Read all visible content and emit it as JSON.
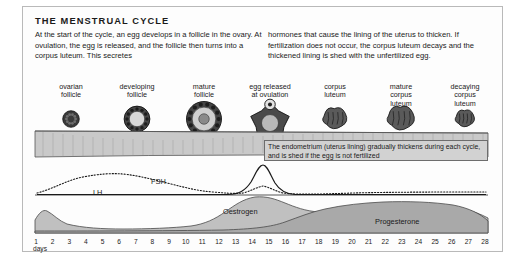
{
  "title": "THE MENSTRUAL CYCLE",
  "intro": {
    "left": "At the start of the cycle, an egg develops in a follicle in the ovary.  At ovulation, the egg is released, and the follicle then turns into a corpus luteum. This secretes",
    "right": "hormones that cause the lining of the uterus to thicken. If fertilization does not occur, the corpus luteum decays and the thickened lining is shed with the unfertilized egg."
  },
  "stages": [
    {
      "label": "ovarian\nfollicle",
      "icon": "ovarian-follicle-icon",
      "x": 48,
      "size": 9
    },
    {
      "label": "developing\nfollicle",
      "icon": "developing-follicle-icon",
      "x": 114,
      "size": 14
    },
    {
      "label": "mature\nfollicle",
      "icon": "mature-follicle-icon",
      "x": 181,
      "size": 19
    },
    {
      "label": "egg released\nat ovulation",
      "icon": "egg-released-icon",
      "x": 247,
      "size": 22
    },
    {
      "label": "corpus\nluteum",
      "icon": "corpus-luteum-icon",
      "x": 312,
      "size": 15
    },
    {
      "label": "mature\ncorpus\nluteum",
      "icon": "mature-corpus-luteum-icon",
      "x": 378,
      "size": 17
    },
    {
      "label": "decaying\ncorpus\nluteum",
      "icon": "decaying-corpus-luteum-icon",
      "x": 442,
      "size": 12
    }
  ],
  "endometrium_note": "The endometrium (uterus lining) gradually thickens during each cycle, and is shed if the egg is not fertilized",
  "hormone_labels": {
    "lh": "LH",
    "fsh": "FSH",
    "oestrogen": "Oestrogen",
    "progesterone": "Progesterone"
  },
  "axis": {
    "unit_label": "days",
    "days": [
      1,
      2,
      3,
      4,
      5,
      6,
      7,
      8,
      9,
      10,
      11,
      12,
      13,
      14,
      15,
      16,
      17,
      18,
      19,
      20,
      21,
      22,
      23,
      24,
      25,
      26,
      27,
      28
    ]
  },
  "colors": {
    "panel_border": "#b9b9b9",
    "ink": "#1a1a1a",
    "endometrium_fill": "#c9c9c9",
    "oestrogen_fill": "#c0c0c0",
    "progesterone_fill": "#a9a9a9",
    "note_fill": "#d2d2d2"
  },
  "chart_data": {
    "type": "line",
    "title": "THE MENSTRUAL CYCLE",
    "xlabel": "days",
    "ylabel": "",
    "xlim": [
      1,
      28
    ],
    "grid": false,
    "legend": "inline-labels",
    "series": [
      {
        "name": "FSH",
        "style": "dotted",
        "x": [
          1,
          3,
          5,
          7,
          9,
          11,
          13,
          14,
          15,
          17,
          19,
          21,
          23,
          25,
          28
        ],
        "values": [
          6,
          16,
          22,
          24,
          22,
          18,
          14,
          20,
          13,
          8,
          8,
          8,
          8,
          7,
          6
        ]
      },
      {
        "name": "LH",
        "style": "solid",
        "x": [
          1,
          5,
          9,
          11,
          12,
          13,
          14,
          15,
          16,
          17,
          19,
          22,
          25,
          28
        ],
        "values": [
          4,
          4,
          4,
          5,
          10,
          30,
          54,
          30,
          10,
          5,
          4,
          4,
          4,
          4
        ]
      },
      {
        "name": "Oestrogen",
        "style": "filled-area",
        "x": [
          1,
          2,
          4,
          6,
          8,
          10,
          11,
          12,
          13,
          14,
          15,
          16,
          17,
          18,
          19,
          20,
          22,
          24,
          26,
          27,
          28
        ],
        "values": [
          16,
          12,
          7,
          6,
          6,
          7,
          10,
          20,
          32,
          40,
          38,
          33,
          30,
          29,
          28,
          30,
          33,
          33,
          28,
          16,
          4
        ]
      },
      {
        "name": "Progesterone",
        "style": "filled-area",
        "x": [
          1,
          5,
          10,
          14,
          15,
          16,
          17,
          18,
          19,
          20,
          21,
          22,
          23,
          24,
          25,
          26,
          27,
          28
        ],
        "values": [
          3,
          3,
          3,
          4,
          6,
          9,
          13,
          18,
          22,
          25,
          27,
          28,
          29,
          28,
          26,
          22,
          15,
          4
        ]
      }
    ],
    "annotations": [
      {
        "text": "The endometrium (uterus lining) gradually thickens during each cycle, and is shed if the egg is not fertilized",
        "target": "endometrium-band"
      }
    ]
  }
}
